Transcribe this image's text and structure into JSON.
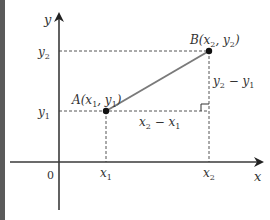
{
  "diagram": {
    "axes": {
      "x_label": "x",
      "y_label": "y",
      "origin_label": "0"
    },
    "points": [
      {
        "name": "A",
        "label": "A(x",
        "sub1": "1",
        "mid": ", y",
        "sub2": "1",
        "end": ")"
      },
      {
        "name": "B",
        "label": "B(x",
        "sub1": "2",
        "mid": ", y",
        "sub2": "2",
        "end": ")"
      }
    ],
    "ticks": {
      "x1": {
        "base": "x",
        "sub": "1"
      },
      "x2": {
        "base": "x",
        "sub": "2"
      },
      "y1": {
        "base": "y",
        "sub": "1"
      },
      "y2": {
        "base": "y",
        "sub": "2"
      }
    },
    "differences": {
      "horizontal": {
        "a": "x",
        "a_sub": "2",
        "op": " − ",
        "b": "x",
        "b_sub": "1"
      },
      "vertical": {
        "a": "y",
        "a_sub": "2",
        "op": " − ",
        "b": "y",
        "b_sub": "1"
      }
    },
    "colors": {
      "axis": "#3a3a3a",
      "segment": "#7a7a7a",
      "dashed": "#555555",
      "point": "#111111",
      "left_bar": "#5a5a5a"
    }
  }
}
